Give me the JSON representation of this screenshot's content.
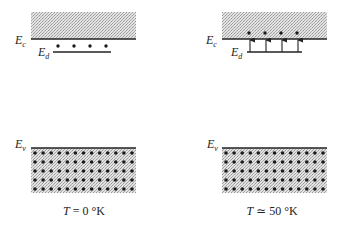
{
  "panels": [
    {
      "id": "t0",
      "caption": "T = 0 °K",
      "caption_parts": {
        "var": "T",
        "rest": " = 0 °K"
      },
      "labels": {
        "ec_main": "E",
        "ec_sub": "c",
        "ed_main": "E",
        "ed_sub": "d",
        "ev_main": "E",
        "ev_sub": "v"
      },
      "donor_state": "electrons bound at donor level",
      "donor_electrons": 4,
      "valence_dot_columns": 13,
      "valence_dot_rows": 5
    },
    {
      "id": "t50",
      "caption": "T ≃ 50 °K",
      "caption_parts": {
        "var": "T",
        "rest": " ≃ 50 °K"
      },
      "labels": {
        "ec_main": "E",
        "ec_sub": "c",
        "ed_main": "E",
        "ed_sub": "d",
        "ev_main": "E",
        "ev_sub": "v"
      },
      "donor_state": "electrons excited from donor level into conduction band",
      "donor_electrons": 4,
      "valence_dot_columns": 13,
      "valence_dot_rows": 5
    }
  ],
  "colors": {
    "band_fill": "#c8c8c8",
    "line": "#222222",
    "dot": "#1a1a1a",
    "background": "#ffffff"
  }
}
